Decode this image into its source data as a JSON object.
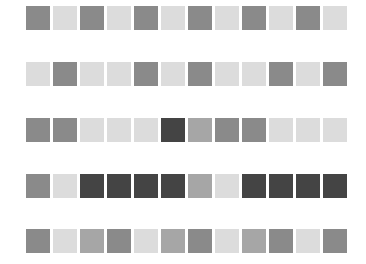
{
  "palette": {
    "L": "#dcdcdc",
    "m": "#a6a6a6",
    "M": "#8a8a8a",
    "D": "#444444"
  },
  "rows": [
    {
      "top": 6,
      "cells": [
        "M",
        "L",
        "M",
        "L",
        "M",
        "L",
        "M",
        "L",
        "M",
        "L",
        "M",
        "L"
      ]
    },
    {
      "top": 62,
      "cells": [
        "L",
        "M",
        "L",
        "L",
        "M",
        "L",
        "M",
        "L",
        "L",
        "M",
        "L",
        "M"
      ]
    },
    {
      "top": 118,
      "cells": [
        "M",
        "M",
        "L",
        "L",
        "L",
        "D",
        "m",
        "M",
        "M",
        "L",
        "L",
        "L"
      ]
    },
    {
      "top": 174,
      "cells": [
        "M",
        "L",
        "D",
        "D",
        "D",
        "D",
        "m",
        "L",
        "D",
        "D",
        "D",
        "D"
      ]
    },
    {
      "top": 229,
      "cells": [
        "M",
        "L",
        "m",
        "M",
        "L",
        "m",
        "M",
        "L",
        "m",
        "M",
        "L",
        "M"
      ]
    }
  ]
}
